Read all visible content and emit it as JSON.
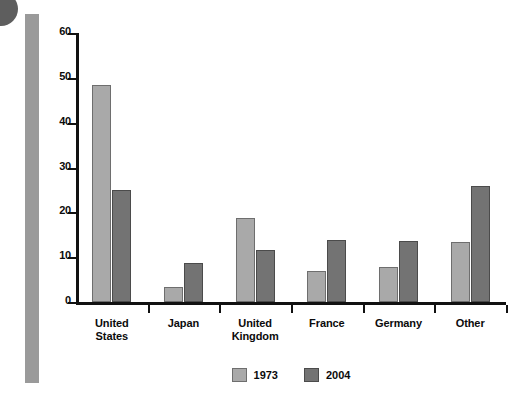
{
  "chart_data": {
    "type": "bar",
    "title": "",
    "subtitle": "",
    "xlabel": "",
    "ylabel": "",
    "categories": [
      "United States",
      "Japan",
      "United Kingdom",
      "France",
      "Germany",
      "Other"
    ],
    "category_lines": [
      [
        "United",
        "States"
      ],
      [
        "Japan"
      ],
      [
        "United",
        "Kingdom"
      ],
      [
        "France"
      ],
      [
        "Germany"
      ],
      [
        "Other"
      ]
    ],
    "series": [
      {
        "name": "1973",
        "color": "#a9a9a9",
        "values": [
          48.5,
          3.3,
          18.7,
          7.0,
          7.7,
          13.4
        ]
      },
      {
        "name": "2004",
        "color": "#737373",
        "values": [
          25.0,
          8.7,
          11.7,
          13.8,
          13.7,
          25.8
        ]
      }
    ],
    "ylim": [
      0,
      60
    ],
    "yticks": [
      0,
      10,
      20,
      30,
      40,
      50,
      60
    ],
    "ytick_labels": [
      "0",
      "10",
      "20",
      "30",
      "40",
      "50",
      "60"
    ],
    "grid": false,
    "legend_position": "bottom-center"
  },
  "decorations": {
    "corner_circle": "corner-circle-mark",
    "left_rule": "left-margin-rule"
  },
  "colors": {
    "series_1973": "#a9a9a9",
    "series_2004": "#737373",
    "axis": "#111111",
    "left_rule": "#9a9a9a",
    "background": "#ffffff"
  }
}
